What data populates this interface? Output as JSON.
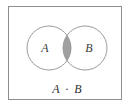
{
  "figure": {
    "type": "venn-diagram",
    "caption": "A · B",
    "frame": {
      "border_color": "#8e8e8e",
      "background_color": "#ffffff"
    },
    "sets": [
      {
        "id": "set-a",
        "label": "A",
        "cx": 49,
        "cy": 48,
        "r": 22,
        "stroke_color": "#9a9a9a",
        "fill_color": "none",
        "label_x": 45,
        "label_y": 52
      },
      {
        "id": "set-b",
        "label": "B",
        "cx": 85,
        "cy": 48,
        "r": 22,
        "stroke_color": "#9a9a9a",
        "fill_color": "none",
        "label_x": 82,
        "label_y": 52
      }
    ],
    "intersection": {
      "id": "intersection-region",
      "name": "A and B",
      "shaded": true,
      "fill_color": "#a0a0a0"
    },
    "expression": {
      "left_operand": "A",
      "operator": "·",
      "right_operand": "B",
      "full_text": "A · B",
      "x": 67,
      "y": 92
    }
  }
}
